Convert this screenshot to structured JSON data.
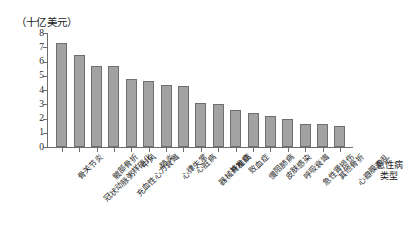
{
  "chart_data": {
    "type": "bar",
    "title": "",
    "subtitle": "",
    "ylabel": "（十亿美元）",
    "xlabel": "急性病\n类型",
    "xlabel_lines": [
      "急性病",
      "类型"
    ],
    "ylim": [
      0,
      8
    ],
    "ytick_labels": [
      "0",
      "1",
      "2",
      "3",
      "4",
      "5",
      "6",
      "7",
      "8"
    ],
    "ytick_values": [
      0,
      1,
      2,
      3,
      4,
      5,
      6,
      7,
      8
    ],
    "grid": false,
    "legend": "none",
    "bar_color": "#a2a2a2",
    "bar_edge_color": "#6f6f6f",
    "axis_color": "#6d6d6d",
    "categories": [
      "骨关节炎",
      "冠状动脉粥样硬化",
      "髋部骨折",
      "充血性心力衰竭",
      "中风",
      "肺炎",
      "心律失常",
      "心脏病",
      "器械并发症",
      "脊椎病",
      "败血症",
      "慢阻肺病",
      "皮肤感染",
      "呼吸衰竭",
      "急性肾损伤",
      "其他骨折",
      "心瓣膜紊乱"
    ],
    "values": [
      7.3,
      6.45,
      5.7,
      5.7,
      4.75,
      4.6,
      4.35,
      4.3,
      3.1,
      3.05,
      2.6,
      2.4,
      2.2,
      2.0,
      1.65,
      1.65,
      1.45
    ]
  }
}
